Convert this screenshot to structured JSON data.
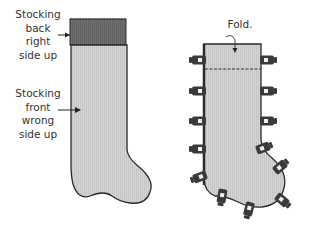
{
  "labels": {
    "back": [
      "Stocking",
      "back",
      "right",
      "side up"
    ],
    "front": [
      "Stocking",
      "front",
      "wrong",
      "side up"
    ],
    "fold": "Fold."
  },
  "colors": {
    "back_fabric": "#6e6e6e",
    "front_fabric": "#d2d2d2",
    "outline": "#2a2a2a",
    "clip": "#3a3a3a",
    "text": "#333333"
  }
}
